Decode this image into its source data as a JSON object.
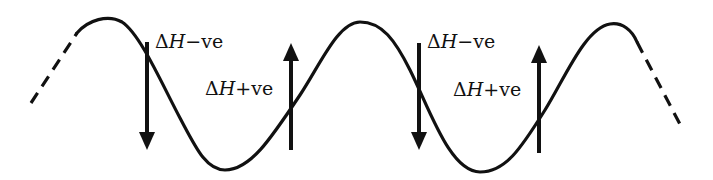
{
  "diagram": {
    "type": "wave-with-enthalpy-arrows",
    "curve": {
      "dashed_start": [
        [
          31,
          103
        ],
        [
          77,
          33
        ]
      ],
      "dashed_end": [
        [
          637,
          42
        ],
        [
          683,
          130
        ]
      ],
      "peaks": [
        [
          100,
          20
        ],
        [
          360,
          22
        ],
        [
          610,
          24
        ]
      ],
      "troughs": [
        [
          215,
          170
        ],
        [
          480,
          172
        ]
      ]
    },
    "arrows": [
      {
        "direction": "down",
        "x": 147,
        "y_top": 42,
        "y_bottom": 150,
        "label": {
          "delta": "Δ",
          "symbol": "H",
          "sign_text": "−ve",
          "x": 155,
          "y": 32
        }
      },
      {
        "direction": "up",
        "x": 291,
        "y_top": 43,
        "y_bottom": 150,
        "label": {
          "delta": "Δ",
          "symbol": "H",
          "sign_text": "+ve",
          "x": 205,
          "y": 79
        }
      },
      {
        "direction": "down",
        "x": 419,
        "y_top": 43,
        "y_bottom": 150,
        "label": {
          "delta": "Δ",
          "symbol": "H",
          "sign_text": "−ve",
          "x": 427,
          "y": 32
        }
      },
      {
        "direction": "up",
        "x": 539,
        "y_top": 45,
        "y_bottom": 153,
        "label": {
          "delta": "Δ",
          "symbol": "H",
          "sign_text": "+ve",
          "x": 453,
          "y": 80
        }
      }
    ],
    "colors": {
      "ink": "#111111",
      "background": "#ffffff"
    }
  }
}
